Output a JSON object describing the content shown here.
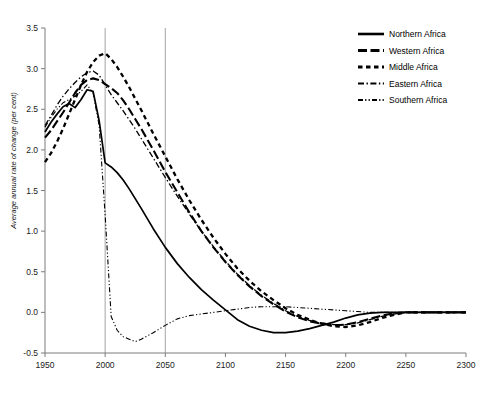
{
  "chart_data": {
    "type": "line",
    "title": "",
    "xlabel": "",
    "ylabel": "Average annual rate of change (per cent)",
    "xlim": [
      1950,
      2300
    ],
    "ylim": [
      -0.5,
      3.5
    ],
    "xticks": [
      1950,
      2000,
      2050,
      2100,
      2150,
      2200,
      2250,
      2300
    ],
    "xtick_labels": [
      "1950",
      "2000",
      "2050",
      "2100",
      "2150",
      "2200",
      "2250",
      "2300"
    ],
    "yticks": [
      -0.5,
      0.0,
      0.5,
      1.0,
      1.5,
      2.0,
      2.5,
      3.0,
      3.5
    ],
    "ytick_labels": [
      "-0.5",
      "0.0",
      "0.5",
      "1.0",
      "1.5",
      "2.0",
      "2.5",
      "3.0",
      "3.5"
    ],
    "grid": "vertical-at-2000-and-2050",
    "legend_position": "top-right",
    "x": [
      1950,
      1955,
      1960,
      1965,
      1970,
      1975,
      1980,
      1985,
      1990,
      1995,
      2000,
      2005,
      2010,
      2015,
      2020,
      2025,
      2030,
      2040,
      2050,
      2060,
      2070,
      2080,
      2090,
      2100,
      2110,
      2120,
      2130,
      2140,
      2150,
      2160,
      2170,
      2180,
      2190,
      2200,
      2210,
      2220,
      2230,
      2240,
      2250,
      2260,
      2270,
      2280,
      2290,
      2300
    ],
    "series": [
      {
        "name": "Northern Africa",
        "style": "solid",
        "values": [
          2.22,
          2.34,
          2.44,
          2.53,
          2.57,
          2.52,
          2.62,
          2.74,
          2.72,
          2.36,
          1.84,
          1.79,
          1.72,
          1.63,
          1.52,
          1.4,
          1.28,
          1.03,
          0.8,
          0.6,
          0.43,
          0.28,
          0.15,
          0.03,
          -0.09,
          -0.17,
          -0.22,
          -0.25,
          -0.25,
          -0.23,
          -0.2,
          -0.16,
          -0.12,
          -0.07,
          -0.03,
          -0.01,
          0.0,
          0.0,
          0.0,
          0.0,
          0.0,
          0.0,
          0.0,
          0.0
        ]
      },
      {
        "name": "Western Africa",
        "style": "long-dash",
        "values": [
          2.15,
          2.24,
          2.35,
          2.46,
          2.58,
          2.7,
          2.8,
          2.86,
          2.88,
          2.86,
          2.81,
          2.76,
          2.7,
          2.61,
          2.5,
          2.38,
          2.26,
          2.0,
          1.73,
          1.48,
          1.23,
          1.0,
          0.8,
          0.62,
          0.46,
          0.32,
          0.2,
          0.1,
          0.01,
          -0.06,
          -0.11,
          -0.14,
          -0.16,
          -0.15,
          -0.12,
          -0.08,
          -0.04,
          -0.01,
          0.0,
          0.0,
          0.0,
          0.0,
          0.0,
          0.0
        ]
      },
      {
        "name": "Middle Africa",
        "style": "dash",
        "values": [
          1.85,
          1.96,
          2.1,
          2.26,
          2.44,
          2.62,
          2.8,
          2.96,
          3.08,
          3.16,
          3.19,
          3.12,
          3.02,
          2.9,
          2.77,
          2.63,
          2.49,
          2.2,
          1.92,
          1.64,
          1.38,
          1.14,
          0.92,
          0.72,
          0.54,
          0.39,
          0.26,
          0.15,
          0.05,
          -0.03,
          -0.09,
          -0.14,
          -0.17,
          -0.18,
          -0.16,
          -0.12,
          -0.07,
          -0.03,
          0.0,
          0.0,
          0.0,
          0.0,
          0.0,
          0.0
        ]
      },
      {
        "name": "Eastern Africa",
        "style": "dash-dot",
        "values": [
          2.3,
          2.42,
          2.55,
          2.66,
          2.75,
          2.83,
          2.9,
          2.95,
          2.97,
          2.92,
          2.8,
          2.68,
          2.58,
          2.48,
          2.37,
          2.26,
          2.14,
          1.9,
          1.66,
          1.43,
          1.21,
          1.0,
          0.81,
          0.63,
          0.47,
          0.33,
          0.21,
          0.11,
          0.02,
          -0.05,
          -0.1,
          -0.13,
          -0.15,
          -0.15,
          -0.13,
          -0.09,
          -0.05,
          -0.02,
          0.0,
          0.0,
          0.0,
          0.0,
          0.0,
          0.0
        ]
      },
      {
        "name": "Southern Africa",
        "style": "dash-dot-dot",
        "values": [
          2.28,
          2.4,
          2.5,
          2.58,
          2.62,
          2.66,
          2.72,
          2.8,
          2.7,
          2.3,
          1.2,
          -0.05,
          -0.22,
          -0.3,
          -0.33,
          -0.36,
          -0.33,
          -0.25,
          -0.16,
          -0.08,
          -0.04,
          -0.02,
          0.0,
          0.02,
          0.04,
          0.06,
          0.07,
          0.07,
          0.07,
          0.06,
          0.05,
          0.04,
          0.03,
          0.02,
          0.01,
          0.0,
          0.0,
          0.0,
          0.0,
          0.0,
          0.0,
          0.0,
          0.0,
          0.0
        ]
      }
    ]
  },
  "legend": {
    "items": [
      {
        "label": "Northern Africa",
        "style": "solid"
      },
      {
        "label": "Western Africa",
        "style": "long-dash"
      },
      {
        "label": "Middle Africa",
        "style": "dash"
      },
      {
        "label": "Eastern Africa",
        "style": "dash-dot"
      },
      {
        "label": "Southern Africa",
        "style": "dash-dot-dot"
      }
    ]
  }
}
